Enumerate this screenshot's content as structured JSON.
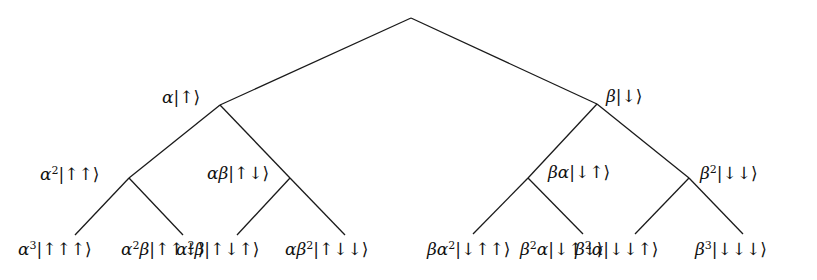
{
  "diagram": {
    "title": "",
    "root": {
      "id": "root",
      "label": "",
      "children": [
        {
          "id": "a",
          "label": "α|↑⟩",
          "coef": [
            [
              "α",
              ""
            ]
          ],
          "ket": "↑",
          "children": [
            {
              "id": "aa",
              "label": "α²|↑↑⟩",
              "coef": [
                [
                  "α",
                  "2"
                ]
              ],
              "ket": "↑↑",
              "children": [
                {
                  "id": "aaa",
                  "label": "α³|↑↑↑⟩",
                  "coef": [
                    [
                      "α",
                      "3"
                    ]
                  ],
                  "ket": "↑↑↑"
                },
                {
                  "id": "aab",
                  "label": "α²β|↑↑↓⟩",
                  "coef": [
                    [
                      "α",
                      "2"
                    ],
                    [
                      "β",
                      ""
                    ]
                  ],
                  "ket": "↑↑↓"
                }
              ]
            },
            {
              "id": "ab",
              "label": "αβ|↑↓⟩",
              "coef": [
                [
                  "α",
                  ""
                ],
                [
                  "β",
                  ""
                ]
              ],
              "ket": "↑↓",
              "children": [
                {
                  "id": "aba",
                  "label": "α²β|↑↓↑⟩",
                  "coef": [
                    [
                      "α",
                      "2"
                    ],
                    [
                      "β",
                      ""
                    ]
                  ],
                  "ket": "↑↓↑"
                },
                {
                  "id": "abb",
                  "label": "αβ²|↑↓↓⟩",
                  "coef": [
                    [
                      "α",
                      ""
                    ],
                    [
                      "β",
                      "2"
                    ]
                  ],
                  "ket": "↑↓↓"
                }
              ]
            }
          ]
        },
        {
          "id": "b",
          "label": "β|↓⟩",
          "coef": [
            [
              "β",
              ""
            ]
          ],
          "ket": "↓",
          "children": [
            {
              "id": "ba",
              "label": "βα|↓↑⟩",
              "coef": [
                [
                  "β",
                  ""
                ],
                [
                  "α",
                  ""
                ]
              ],
              "ket": "↓↑",
              "children": [
                {
                  "id": "baa",
                  "label": "βα²|↓↑↑⟩",
                  "coef": [
                    [
                      "β",
                      ""
                    ],
                    [
                      "α",
                      "2"
                    ]
                  ],
                  "ket": "↓↑↑"
                },
                {
                  "id": "bab",
                  "label": "β²α|↓↑↓⟩",
                  "coef": [
                    [
                      "β",
                      "2"
                    ],
                    [
                      "α",
                      ""
                    ]
                  ],
                  "ket": "↓↑↓"
                }
              ]
            },
            {
              "id": "bb",
              "label": "β²|↓↓⟩",
              "coef": [
                [
                  "β",
                  "2"
                ]
              ],
              "ket": "↓↓",
              "children": [
                {
                  "id": "bba",
                  "label": "β²α|↓↓↑⟩",
                  "coef": [
                    [
                      "β",
                      "2"
                    ],
                    [
                      "α",
                      ""
                    ]
                  ],
                  "ket": "↓↓↑"
                },
                {
                  "id": "bbb",
                  "label": "β³|↓↓↓⟩",
                  "coef": [
                    [
                      "β",
                      "3"
                    ]
                  ],
                  "ket": "↓↓↓"
                }
              ]
            }
          ]
        }
      ]
    }
  }
}
